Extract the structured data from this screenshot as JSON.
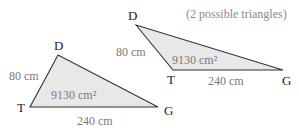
{
  "note": "(2 possible triangles)",
  "colors": {
    "fill": "#e8e8e8",
    "stroke": "#333333",
    "vertex_label": "#222222",
    "measure_label": "#7a7a7a"
  },
  "triangles": [
    {
      "id": "acute",
      "vertices": {
        "D": "D",
        "T": "T",
        "G": "G"
      },
      "side_DT": "80 cm",
      "side_TG": "240 cm",
      "area": "9130 cm²"
    },
    {
      "id": "obtuse",
      "vertices": {
        "D": "D",
        "T": "T",
        "G": "G"
      },
      "side_DT": "80 cm",
      "side_TG": "240 cm",
      "area": "9130 cm²"
    }
  ]
}
